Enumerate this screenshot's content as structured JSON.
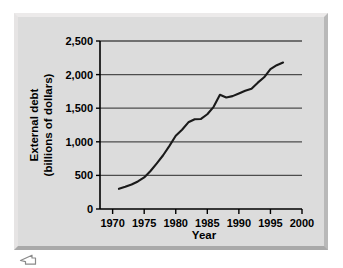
{
  "figure": {
    "frame_style": "beveled-gray-border",
    "background_color": "#dcdcdc",
    "line_color": "#1a1a1a",
    "grid_color": "#4d4d4d",
    "axis_color": "#000000"
  },
  "cursor": {
    "icon_name": "pointer-cursor-icon"
  },
  "chart_data": {
    "type": "line",
    "title": "",
    "xlabel": "Year",
    "ylabel": "External debt (billions of dollars)",
    "ylabel_line1": "External debt",
    "ylabel_line2": "(billions of dollars)",
    "xlim": [
      1968,
      2000
    ],
    "ylim": [
      0,
      2500
    ],
    "xticks": [
      1970,
      1975,
      1980,
      1985,
      1990,
      1995,
      2000
    ],
    "xtick_labels": [
      "1970",
      "1975",
      "1980",
      "1985",
      "1990",
      "1995",
      "2000"
    ],
    "yticks": [
      0,
      500,
      1000,
      1500,
      2000,
      2500
    ],
    "ytick_labels": [
      "0",
      "500",
      "1,000",
      "1,500",
      "2,000",
      "2,500"
    ],
    "grid": "horizontal",
    "legend": "none",
    "series": [
      {
        "name": "External debt",
        "x": [
          1971,
          1972,
          1973,
          1974,
          1975,
          1976,
          1977,
          1978,
          1979,
          1980,
          1981,
          1982,
          1983,
          1984,
          1985,
          1986,
          1987,
          1988,
          1989,
          1990,
          1991,
          1992,
          1993,
          1994,
          1995,
          1996,
          1997
        ],
        "values": [
          300,
          330,
          365,
          410,
          470,
          565,
          680,
          800,
          940,
          1090,
          1180,
          1290,
          1335,
          1340,
          1410,
          1520,
          1700,
          1660,
          1680,
          1720,
          1760,
          1790,
          1880,
          1960,
          2080,
          2140,
          2180
        ]
      }
    ]
  }
}
